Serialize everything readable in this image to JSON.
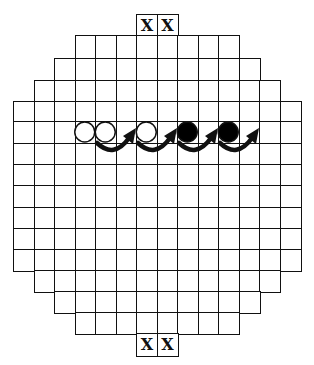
{
  "diagram": {
    "type": "board-game-grid",
    "grid": {
      "cell_size_px": 20.5,
      "origin_x": 13,
      "columns_full": 14,
      "rows": [
        {
          "row": 0,
          "y": 14,
          "h": 21,
          "cols": [
            6,
            7
          ],
          "marked": "X"
        },
        {
          "row": 1,
          "y": 35,
          "h": 23,
          "cols": [
            3,
            10
          ]
        },
        {
          "row": 2,
          "y": 58,
          "h": 22,
          "cols": [
            2,
            11
          ]
        },
        {
          "row": 3,
          "y": 80,
          "h": 21,
          "cols": [
            1,
            12
          ]
        },
        {
          "row": 4,
          "y": 101,
          "h": 20,
          "cols": [
            0,
            13
          ]
        },
        {
          "row": 5,
          "y": 121,
          "h": 22,
          "cols": [
            0,
            13
          ]
        },
        {
          "row": 6,
          "y": 143,
          "h": 21,
          "cols": [
            0,
            13
          ]
        },
        {
          "row": 7,
          "y": 164,
          "h": 21,
          "cols": [
            0,
            13
          ]
        },
        {
          "row": 8,
          "y": 185,
          "h": 22,
          "cols": [
            0,
            13
          ]
        },
        {
          "row": 9,
          "y": 207,
          "h": 21,
          "cols": [
            0,
            13
          ]
        },
        {
          "row": 10,
          "y": 228,
          "h": 21,
          "cols": [
            0,
            13
          ]
        },
        {
          "row": 11,
          "y": 249,
          "h": 21,
          "cols": [
            0,
            13
          ]
        },
        {
          "row": 12,
          "y": 270,
          "h": 21,
          "cols": [
            1,
            12
          ]
        },
        {
          "row": 13,
          "y": 291,
          "h": 21,
          "cols": [
            2,
            11
          ]
        },
        {
          "row": 14,
          "y": 312,
          "h": 21,
          "cols": [
            3,
            10
          ]
        },
        {
          "row": 15,
          "y": 333,
          "h": 22,
          "cols": [
            6,
            7
          ],
          "marked": "X"
        }
      ]
    },
    "marker_label": "X",
    "stones": [
      {
        "row": 5,
        "col": 3,
        "color": "white"
      },
      {
        "row": 5,
        "col": 4,
        "color": "white"
      },
      {
        "row": 5,
        "col": 6,
        "color": "white"
      },
      {
        "row": 5,
        "col": 8,
        "color": "black"
      },
      {
        "row": 5,
        "col": 10,
        "color": "black"
      }
    ],
    "arrows": [
      {
        "from_col": 4,
        "to_col": 5,
        "row": 5,
        "direction": "clockwise-curve-right"
      },
      {
        "from_col": 6,
        "to_col": 7,
        "row": 5,
        "direction": "clockwise-curve-right"
      },
      {
        "from_col": 8,
        "to_col": 9,
        "row": 5,
        "direction": "clockwise-curve-right"
      },
      {
        "from_col": 10,
        "to_col": 11,
        "row": 5,
        "direction": "clockwise-curve-right"
      }
    ],
    "colors": {
      "line": "#111111",
      "background": "#ffffff",
      "black_stone": "#000000",
      "white_stone": "#ffffff"
    }
  }
}
